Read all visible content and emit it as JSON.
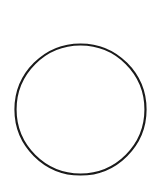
{
  "canvas": {
    "width": 158,
    "height": 182,
    "background": "#ffffff"
  },
  "shapes": [
    {
      "type": "circle",
      "cx": 80.5,
      "cy": 109.5,
      "r": 65,
      "fill": "none",
      "stroke": "#1a1a1a",
      "stroke_width": 2.2
    }
  ]
}
